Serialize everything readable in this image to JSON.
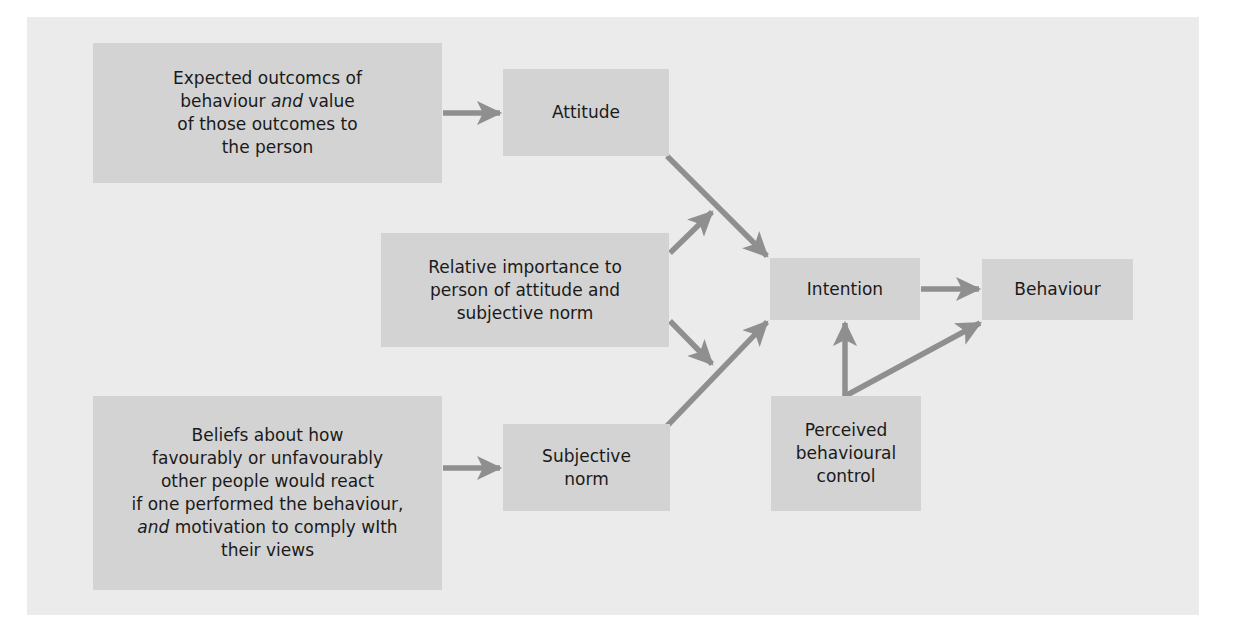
{
  "diagram": {
    "colors": {
      "page_background": "#ffffff",
      "panel_background": "#ebebeb",
      "box_fill": "#d3d3d3",
      "arrow": "#8f8f8f",
      "text": "#1a1a1a"
    },
    "nodes": {
      "expected_outcomes": {
        "lines": [
          "Expected outcomcs of",
          "behaviour",
          "and",
          "value",
          "of those outcomes to",
          "the person"
        ]
      },
      "attitude": {
        "label": "Attitude"
      },
      "relative_importance": {
        "lines": [
          "Relative importance to",
          "person of attitude and",
          "subjective norm"
        ]
      },
      "beliefs": {
        "lines": [
          "Beliefs about how",
          "favourably or unfavourably",
          "other people would react",
          "if one performed the behaviour,",
          "and",
          "motivation to comply wIth",
          "their views"
        ]
      },
      "subjective_norm": {
        "lines": [
          "Subjective",
          "norm"
        ]
      },
      "intention": {
        "label": "Intention"
      },
      "behaviour": {
        "label": "Behaviour"
      },
      "perceived_control": {
        "lines": [
          "Perceived",
          "behavioural",
          "control"
        ]
      }
    },
    "edges": [
      {
        "from": "Expected outcomes of behaviour and value of those outcomes to the person",
        "to": "Attitude"
      },
      {
        "from": "Beliefs about how favourably or unfavourably other people would react...",
        "to": "Subjective norm"
      },
      {
        "from": "Attitude",
        "to": "Intention"
      },
      {
        "from": "Subjective norm",
        "to": "Intention"
      },
      {
        "from": "Relative importance to person of attitude and subjective norm",
        "to": "Attitude→Intention link"
      },
      {
        "from": "Relative importance to person of attitude and subjective norm",
        "to": "Subjective norm→Intention link"
      },
      {
        "from": "Intention",
        "to": "Behaviour"
      },
      {
        "from": "Perceived behavioural control",
        "to": "Intention"
      },
      {
        "from": "Perceived behavioural control",
        "to": "Behaviour"
      }
    ]
  }
}
